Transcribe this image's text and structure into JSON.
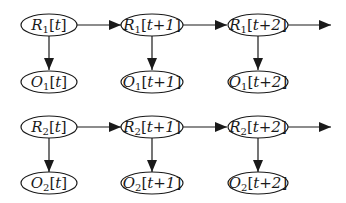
{
  "diagram": {
    "type": "dynamic-bayesian-network",
    "colors": {
      "stroke": "#1a1a1a",
      "background": "#ffffff"
    },
    "rows": [
      {
        "id": "chain-1",
        "hidden": [
          {
            "var": "R",
            "sub": "1",
            "time": "t"
          },
          {
            "var": "R",
            "sub": "1",
            "time": "t+1"
          },
          {
            "var": "R",
            "sub": "1",
            "time": "t+2"
          }
        ],
        "observed": [
          {
            "var": "O",
            "sub": "1",
            "time": "t"
          },
          {
            "var": "O",
            "sub": "1",
            "time": "t+1"
          },
          {
            "var": "O",
            "sub": "1",
            "time": "t+2"
          }
        ]
      },
      {
        "id": "chain-2",
        "hidden": [
          {
            "var": "R",
            "sub": "2",
            "time": "t"
          },
          {
            "var": "R",
            "sub": "2",
            "time": "t+1"
          },
          {
            "var": "R",
            "sub": "2",
            "time": "t+2"
          }
        ],
        "observed": [
          {
            "var": "O",
            "sub": "2",
            "time": "t"
          },
          {
            "var": "O",
            "sub": "2",
            "time": "t+1"
          },
          {
            "var": "O",
            "sub": "2",
            "time": "t+2"
          }
        ]
      }
    ],
    "edges": [
      {
        "from": "R1[t]",
        "to": "R1[t+1]"
      },
      {
        "from": "R1[t+1]",
        "to": "R1[t+2]"
      },
      {
        "from": "R1[t+2]",
        "to": "(continues)"
      },
      {
        "from": "R1[t]",
        "to": "O1[t]"
      },
      {
        "from": "R1[t+1]",
        "to": "O1[t+1]"
      },
      {
        "from": "R1[t+2]",
        "to": "O1[t+2]"
      },
      {
        "from": "R2[t]",
        "to": "R2[t+1]"
      },
      {
        "from": "R2[t+1]",
        "to": "R2[t+2]"
      },
      {
        "from": "R2[t+2]",
        "to": "(continues)"
      },
      {
        "from": "R2[t]",
        "to": "O2[t]"
      },
      {
        "from": "R2[t+1]",
        "to": "O2[t+1]"
      },
      {
        "from": "R2[t+2]",
        "to": "O2[t+2]"
      }
    ]
  }
}
